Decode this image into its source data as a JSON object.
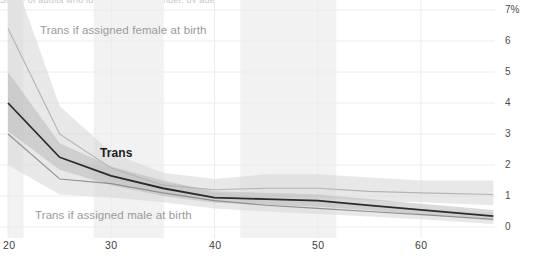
{
  "title_sliver": "Share of adults who identify as transgender, by age",
  "axes": {
    "y_ticks": [
      "7%",
      "6",
      "5",
      "4",
      "3",
      "2",
      "1",
      "0"
    ],
    "y_tick_values": [
      7,
      6,
      5,
      4,
      3,
      2,
      1,
      0
    ],
    "x_ticks": [
      "20",
      "30",
      "40",
      "50",
      "60"
    ],
    "x_tick_values": [
      20,
      30,
      40,
      50,
      60
    ]
  },
  "series_labels": {
    "afab": "Trans if assigned female at birth",
    "amab": "Trans if assigned male at birth",
    "trans": "Trans"
  },
  "colors": {
    "line_trans": "#2b2b2b",
    "line_afab": "#b4b4b4",
    "line_amab": "#8f8f8f",
    "band_outer": "#d6d6d6",
    "band_inner": "#b9b9b9",
    "gridline": "#ececec",
    "highlight_band": "#f2f2f2",
    "tick_text": "#4a4a4a",
    "label_muted": "#9a9a9a",
    "label_dark": "#1a1a1a"
  },
  "chart_data": {
    "type": "line",
    "title": "Share of adults who identify as transgender, by age",
    "xlabel": "Age",
    "ylabel": "",
    "ylim": [
      0,
      7
    ],
    "xlim": [
      20,
      67
    ],
    "grid": true,
    "legend": "inline-labels",
    "y_unit": "%",
    "x": [
      20,
      25,
      30,
      35,
      40,
      45,
      50,
      55,
      60,
      67
    ],
    "series": [
      {
        "name": "Trans if assigned female at birth",
        "color": "#b4b4b4",
        "values": [
          6.4,
          3.0,
          1.9,
          1.35,
          1.2,
          1.25,
          1.25,
          1.15,
          1.1,
          1.05
        ],
        "band_low": [
          4.0,
          2.3,
          1.5,
          1.05,
          0.95,
          0.95,
          0.95,
          0.85,
          0.8,
          0.7
        ],
        "band_high": [
          8.6,
          3.9,
          2.4,
          1.75,
          1.55,
          1.7,
          1.7,
          1.6,
          1.5,
          1.5
        ]
      },
      {
        "name": "Trans",
        "color": "#2b2b2b",
        "values": [
          4.0,
          2.25,
          1.65,
          1.25,
          0.95,
          0.9,
          0.85,
          0.7,
          0.55,
          0.35
        ],
        "band_low": [
          3.1,
          1.85,
          1.35,
          1.0,
          0.78,
          0.72,
          0.66,
          0.54,
          0.4,
          0.2
        ],
        "band_high": [
          5.0,
          2.7,
          1.95,
          1.5,
          1.15,
          1.1,
          1.05,
          0.9,
          0.75,
          0.55
        ]
      },
      {
        "name": "Trans if assigned male at birth",
        "color": "#8f8f8f",
        "values": [
          3.0,
          1.55,
          1.4,
          1.1,
          0.85,
          0.7,
          0.6,
          0.5,
          0.4,
          0.25
        ],
        "band_low": [
          2.0,
          1.05,
          0.95,
          0.8,
          0.6,
          0.5,
          0.42,
          0.34,
          0.25,
          0.1
        ],
        "band_high": [
          4.2,
          2.2,
          1.9,
          1.45,
          1.12,
          0.95,
          0.82,
          0.7,
          0.58,
          0.45
        ]
      }
    ],
    "highlight_bands": [
      {
        "x_start": 20.0,
        "x_end": 21.5
      },
      {
        "x_start": 28.3,
        "x_end": 35.1
      },
      {
        "x_start": 42.5,
        "x_end": 51.8
      }
    ]
  }
}
